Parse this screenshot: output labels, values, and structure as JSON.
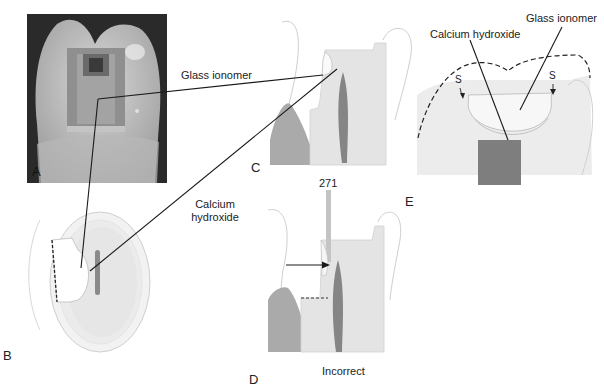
{
  "figure": {
    "panels": [
      {
        "id": "A",
        "letter": "A",
        "type": "photograph"
      },
      {
        "id": "B",
        "letter": "B",
        "type": "occlusal-view-drawing"
      },
      {
        "id": "C",
        "letter": "C",
        "type": "cross-section-drawing"
      },
      {
        "id": "D",
        "letter": "D",
        "type": "cross-section-drawing",
        "caption": "Incorrect",
        "instrument_label": "271"
      },
      {
        "id": "E",
        "letter": "E",
        "type": "cross-section-drawing"
      }
    ],
    "labels": {
      "glass_ionomer_c": "Glass ionomer",
      "calcium_hydroxide_b_line1": "Calcium",
      "calcium_hydroxide_b_line2": "hydroxide",
      "bur_number": "271",
      "incorrect": "Incorrect",
      "e_calcium_hydroxide": "Calcium hydroxide",
      "e_glass_ionomer": "Glass ionomer",
      "e_s_left": "S",
      "e_s_right": "S"
    },
    "colors": {
      "background": "#ffffff",
      "tooth_fill": "#e6e6e6",
      "enamel_outline": "#c8c8c8",
      "pulp": "#8a8a8a",
      "bone": "#b5b5b5",
      "leader_line": "#1a1a1a",
      "photo_bg": "#2a2a2a"
    }
  }
}
